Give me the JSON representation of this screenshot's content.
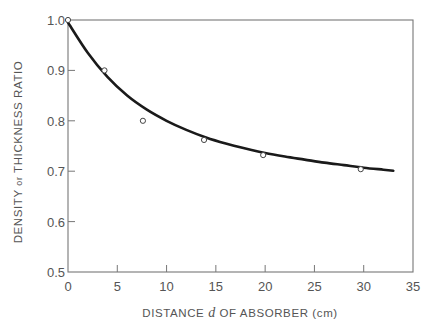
{
  "chart_data": {
    "type": "line",
    "title": "",
    "xlabel": "DISTANCE d OF ABSORBER (cm)",
    "xlabel_parts": {
      "before": "DISTANCE ",
      "italic": "d",
      "after": " OF ABSORBER (cm)"
    },
    "ylabel": "DENSITY or THICKNESS RATIO",
    "ylabel_parts": {
      "before": "DENSITY ",
      "small": "or",
      "after": " THICKNESS RATIO"
    },
    "xlim": [
      0,
      35
    ],
    "ylim": [
      0.5,
      1.0
    ],
    "xticks": [
      0,
      5,
      10,
      15,
      20,
      25,
      30,
      35
    ],
    "xtick_labels": [
      "0",
      "5",
      "10",
      "15",
      "20",
      "25",
      "30",
      "35"
    ],
    "yticks": [
      0.5,
      0.6,
      0.7,
      0.8,
      0.9,
      1.0
    ],
    "ytick_labels": [
      "0.5",
      "0.6",
      "0.7",
      "0.8",
      "0.9",
      "1.0"
    ],
    "grid": false,
    "legend": null,
    "series": [
      {
        "name": "measured",
        "style": "open-circle-markers",
        "x": [
          0,
          3.7,
          7.6,
          13.8,
          19.8,
          29.7
        ],
        "y": [
          1.0,
          0.9,
          0.8,
          0.762,
          0.732,
          0.704
        ]
      },
      {
        "name": "fitted curve",
        "style": "solid-line",
        "x": [
          0,
          2,
          4,
          6,
          8,
          10,
          12,
          14,
          16,
          18,
          20,
          22,
          24,
          26,
          28,
          30,
          32,
          33
        ],
        "y": [
          0.995,
          0.935,
          0.887,
          0.85,
          0.822,
          0.8,
          0.782,
          0.767,
          0.755,
          0.745,
          0.736,
          0.729,
          0.723,
          0.717,
          0.712,
          0.707,
          0.703,
          0.701
        ]
      }
    ]
  },
  "colors": {
    "axis": "#777777",
    "curve": "#1a1a1a",
    "marker": "#444444",
    "text": "#555555"
  }
}
